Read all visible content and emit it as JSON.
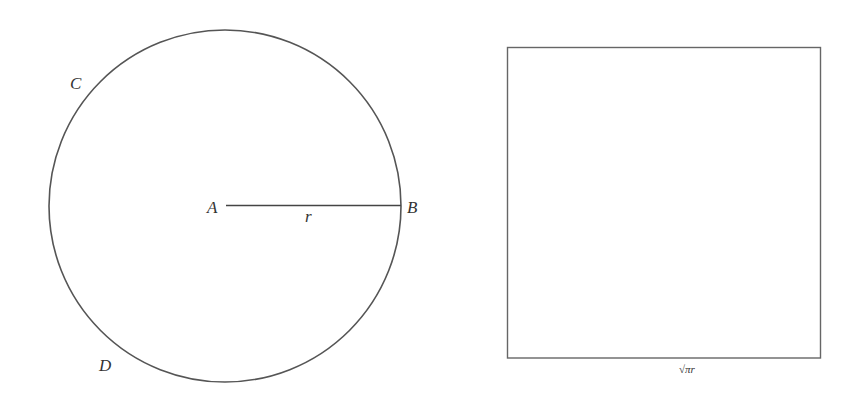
{
  "diagram": {
    "circle": {
      "center_label": "A",
      "radius_end_label": "B",
      "radius_label": "r",
      "arc_labels": [
        "C",
        "D"
      ],
      "stroke_color": "#555555"
    },
    "square": {
      "side_label": "√πr",
      "stroke_color": "#666666"
    }
  }
}
